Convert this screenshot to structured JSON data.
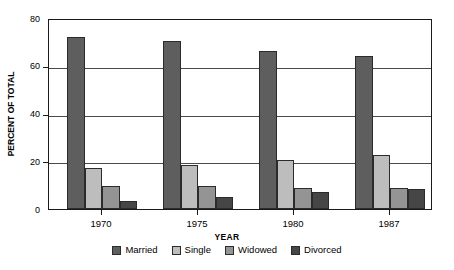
{
  "chart_data": {
    "type": "bar",
    "title": "",
    "xlabel": "YEAR",
    "ylabel": "PERCENT OF TOTAL",
    "categories": [
      "1970",
      "1975",
      "1980",
      "1987"
    ],
    "ylim": [
      0,
      80
    ],
    "yticks": [
      0,
      20,
      40,
      60,
      80
    ],
    "ytick_labels": [
      "0",
      "20",
      "40",
      "60",
      "80"
    ],
    "grid": true,
    "legend_position": "bottom",
    "series": [
      {
        "name": "Married",
        "color": "#5e5e5e",
        "values": [
          72,
          70.5,
          66,
          64
        ]
      },
      {
        "name": "Single",
        "color": "#bdbdbd",
        "values": [
          17,
          18.5,
          20.5,
          22.5
        ]
      },
      {
        "name": "Widowed",
        "color": "#949494",
        "values": [
          9.5,
          9.5,
          9,
          9
        ]
      },
      {
        "name": "Divorced",
        "color": "#464646",
        "values": [
          3.5,
          5,
          7,
          8.5
        ]
      }
    ]
  },
  "axis": {
    "y_title": "PERCENT OF TOTAL",
    "x_title": "YEAR"
  },
  "legend": {
    "items": [
      {
        "label": "Married"
      },
      {
        "label": "Single"
      },
      {
        "label": "Widowed"
      },
      {
        "label": "Divorced"
      }
    ]
  }
}
